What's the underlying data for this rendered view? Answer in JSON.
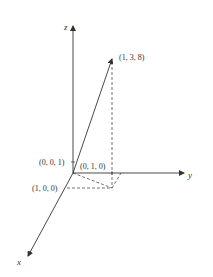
{
  "diagram": {
    "type": "3d-coordinate-vector",
    "axes": {
      "x": {
        "label": "x"
      },
      "y": {
        "label": "y"
      },
      "z": {
        "label": "z"
      }
    },
    "vector": {
      "label": "(1, 3, 8)",
      "components": [
        1,
        3,
        8
      ]
    },
    "unit_points": [
      {
        "label": "(0, 0, 1)"
      },
      {
        "label": "(0, 1, 0)"
      },
      {
        "label": "(1, 0, 0)"
      }
    ],
    "colors": {
      "line": "#333333",
      "background": "#ffffff"
    }
  }
}
